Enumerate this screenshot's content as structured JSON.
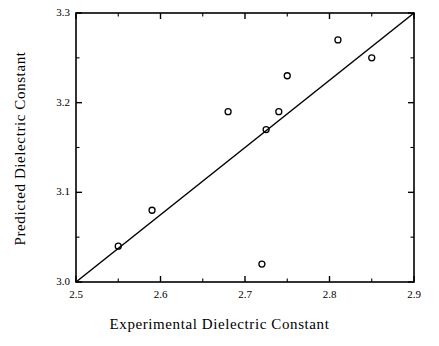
{
  "chart_data": {
    "type": "scatter",
    "title": "",
    "xlabel": "Experimental Dielectric Constant",
    "ylabel": "Predicted Dielectric Constant",
    "xlim": [
      2.5,
      2.9
    ],
    "ylim": [
      3.0,
      3.3
    ],
    "grid": false,
    "legend": null,
    "xticks": [
      2.5,
      2.6,
      2.7,
      2.8,
      2.9
    ],
    "xtick_labels": [
      "2.5",
      "2.6",
      "2.7",
      "2.8",
      "2.9"
    ],
    "yticks": [
      3.0,
      3.1,
      3.2,
      3.3
    ],
    "ytick_labels": [
      "3.0",
      "3.1",
      "3.2",
      "3.3"
    ],
    "xminor_ticks": [
      2.55,
      2.65,
      2.75,
      2.85
    ],
    "yminor_ticks": [
      3.05,
      3.15,
      3.25
    ],
    "marker": "open-circle",
    "marker_color": "#000000",
    "line_color": "#000000",
    "points": [
      {
        "x": 2.55,
        "y": 3.04
      },
      {
        "x": 2.59,
        "y": 3.08
      },
      {
        "x": 2.68,
        "y": 3.19
      },
      {
        "x": 2.72,
        "y": 3.02
      },
      {
        "x": 2.725,
        "y": 3.17
      },
      {
        "x": 2.74,
        "y": 3.19
      },
      {
        "x": 2.75,
        "y": 3.23
      },
      {
        "x": 2.81,
        "y": 3.27
      },
      {
        "x": 2.85,
        "y": 3.25
      }
    ],
    "reference_line": {
      "name": "identity-mapping-line",
      "x": [
        2.5,
        2.9
      ],
      "y": [
        3.0,
        3.3
      ]
    },
    "annotations": []
  },
  "axes": {
    "x_title": "Experimental Dielectric Constant",
    "y_title": "Predicted Dielectric Constant"
  },
  "xtick_labels": [
    "2.5",
    "2.6",
    "2.7",
    "2.8",
    "2.9"
  ],
  "ytick_labels": [
    "3.3",
    "3.2",
    "3.1",
    "3.0"
  ]
}
